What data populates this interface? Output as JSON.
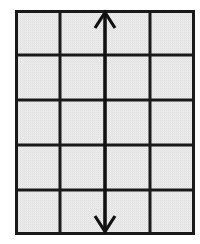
{
  "figure": {
    "title": "Vertical double-headed arrow spanning a 4 by 5 shaded grid",
    "caption": "",
    "background_color": "#ffffff"
  },
  "grid": {
    "name": "shaded-rectangular-grid",
    "columns": 4,
    "rows": 5,
    "cell_count": 20,
    "fill_color": "#e9e9e9",
    "fill_pattern": "halftone-dots",
    "line_color": "#1a1a1a",
    "outer_line_width": 3,
    "inner_line_width": 3,
    "bounds": {
      "x": 15,
      "y": 10,
      "width": 180,
      "height": 225
    },
    "column_edges": [
      15,
      60,
      105,
      150,
      195
    ],
    "row_edges": [
      10,
      55,
      100,
      145,
      190,
      235
    ],
    "cell_width": 45,
    "cell_height": 45
  },
  "arrow": {
    "name": "vertical-double-headed-arrow",
    "orientation": "vertical",
    "double_headed": true,
    "head_style": "open-chevron",
    "color": "#111111",
    "shaft_width": 3,
    "shaft_x": 105,
    "top_tip_y": 12,
    "bottom_tip_y": 232,
    "head_half_width": 10,
    "head_length": 16,
    "spans_rows": 5,
    "label": ""
  },
  "annotations": {
    "labels": []
  }
}
